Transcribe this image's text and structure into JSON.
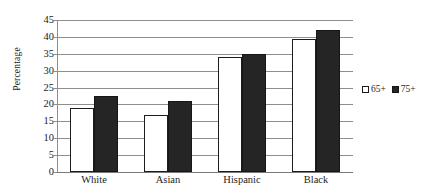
{
  "chart_data": {
    "type": "bar",
    "title": "",
    "xlabel": "",
    "ylabel": "Percentage",
    "categories": [
      "White",
      "Asian",
      "Hispanic",
      "Black"
    ],
    "series": [
      {
        "name": "65+",
        "values": [
          19,
          17,
          34,
          39.5
        ],
        "style": "open"
      },
      {
        "name": "75+",
        "values": [
          22.5,
          21,
          35,
          42
        ],
        "style": "filled"
      }
    ],
    "ylim": [
      0,
      45
    ],
    "ytick_step": 5,
    "yticks": [
      0,
      5,
      10,
      15,
      20,
      25,
      30,
      35,
      40,
      45
    ],
    "ytick_labels": [
      "0",
      "5",
      "10",
      "15",
      "20",
      "25",
      "30",
      "35",
      "40",
      "45"
    ],
    "grid": true,
    "grid_axis": "y",
    "legend_position": "right",
    "legend_entries": [
      "65+",
      "75+"
    ],
    "colors": {
      "series_65_fill": "#ffffff",
      "series_65_edge": "#1c1c1c",
      "series_75_fill": "#252525",
      "series_75_edge": "#161616",
      "gridline": "#8e8e8e",
      "text": "#242424",
      "background": "#ffffff"
    }
  }
}
